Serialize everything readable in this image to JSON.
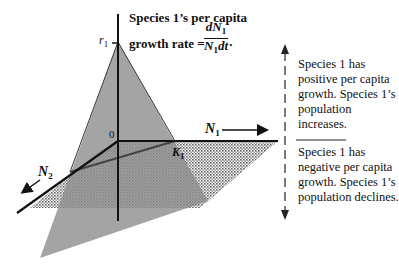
{
  "title": {
    "line1": "Species 1’s per capita",
    "line2": "growth rate =",
    "fraction_numerator": "dN",
    "fraction_numerator_sub": "1",
    "fraction_denominator": "N",
    "fraction_denominator_sub": "1",
    "fraction_denominator_suffix": "dt",
    "trailing": "."
  },
  "labels": {
    "r1": "r",
    "r1_sub": "1",
    "origin": "0",
    "K1": "K",
    "K1_sub": "1",
    "N1": "N",
    "N1_sub": "1",
    "N2": "N",
    "N2_sub": "2"
  },
  "right_panel": {
    "upper_text": "Species 1 has positive per capita growth. Species 1’s population increases.",
    "lower_text": "Species 1 has negative per capita growth. Species 1’s population declines."
  },
  "colors": {
    "triangle_fill": "#8a8a8a",
    "dotted_plane": "#9a9a9a",
    "axis": "#111111"
  }
}
